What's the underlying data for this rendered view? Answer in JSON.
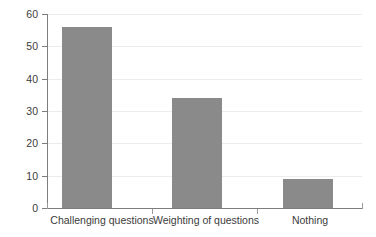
{
  "chart_data": {
    "type": "bar",
    "title": "",
    "subtitle": "",
    "xlabel": "",
    "ylabel": "",
    "categories": [
      "Challenging questions",
      "Weighting of questions",
      "Nothing"
    ],
    "values": [
      56,
      34,
      9
    ],
    "series": [
      {
        "name": "",
        "values": [
          56,
          34,
          9
        ]
      }
    ],
    "ylim": [
      0,
      60
    ],
    "y_ticks": [
      0,
      10,
      20,
      30,
      40,
      50,
      60
    ],
    "y_tick_labels": [
      "0",
      "10",
      "20",
      "30",
      "40",
      "50",
      "60"
    ],
    "grid": "horizontal",
    "legend": "none",
    "bar_color": "#8a8a8a",
    "axis_color": "#7d7d7d",
    "gridline_color": "#ececec",
    "text_color": "#3b3b3b",
    "background": "#ffffff"
  },
  "axes": {
    "y": {
      "ticks": [
        {
          "label": "60",
          "value": 60
        },
        {
          "label": "50",
          "value": 50
        },
        {
          "label": "40",
          "value": 40
        },
        {
          "label": "30",
          "value": 30
        },
        {
          "label": "20",
          "value": 20
        },
        {
          "label": "10",
          "value": 10
        },
        {
          "label": "0",
          "value": 0
        }
      ]
    },
    "x": {
      "ticks": [
        {
          "label": "Challenging questions"
        },
        {
          "label": "Weighting of questions"
        },
        {
          "label": "Nothing"
        }
      ]
    }
  }
}
